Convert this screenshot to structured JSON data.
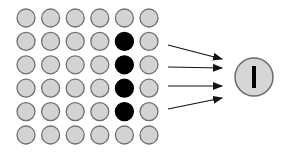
{
  "diagram": {
    "title": "",
    "colors": {
      "inactive_fill": "#d3d3d3",
      "inactive_stroke": "#707070",
      "active_fill": "#000000",
      "arrow": "#111111",
      "output_fill": "#d6d6d6",
      "output_stroke": "#6a6a6a",
      "output_symbol": "#000000"
    },
    "grid": {
      "rows": 6,
      "cols": 6,
      "origin_x": 26,
      "origin_y": 18,
      "step_x": 24.6,
      "step_y": 23.4,
      "radius": 9,
      "active_cells": [
        [
          1,
          4
        ],
        [
          2,
          4
        ],
        [
          3,
          4
        ],
        [
          4,
          4
        ]
      ]
    },
    "arrows": [
      {
        "x1": 168,
        "y1": 45,
        "x2": 222,
        "y2": 59
      },
      {
        "x1": 168,
        "y1": 67,
        "x2": 222,
        "y2": 68
      },
      {
        "x1": 168,
        "y1": 86,
        "x2": 222,
        "y2": 86
      },
      {
        "x1": 168,
        "y1": 109,
        "x2": 222,
        "y2": 98
      }
    ],
    "output": {
      "cx": 254,
      "cy": 77,
      "r": 19,
      "symbol": "vertical-bar"
    }
  }
}
